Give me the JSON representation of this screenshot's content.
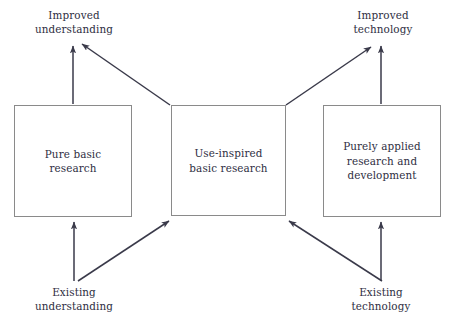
{
  "diagram": {
    "type": "flow-diagram",
    "colors": {
      "box_border": "#8a8a8a",
      "arrow": "#3a3a4a",
      "text": "#2e2e3f",
      "background": "#ffffff"
    },
    "nodes": [
      {
        "id": "pure-basic",
        "label": "Pure basic\nresearch",
        "shape": "rectangle",
        "x": 14,
        "y": 105,
        "width": 118,
        "height": 112
      },
      {
        "id": "use-inspired",
        "label": "Use-inspired\nbasic research",
        "shape": "rectangle",
        "x": 171,
        "y": 105,
        "width": 115,
        "height": 111
      },
      {
        "id": "purely-applied",
        "label": "Purely applied\nresearch and\ndevelopment",
        "shape": "rectangle",
        "x": 323,
        "y": 105,
        "width": 118,
        "height": 112
      }
    ],
    "labels": [
      {
        "id": "improved-understanding",
        "text": "Improved\nunderstanding",
        "position": "top-left"
      },
      {
        "id": "improved-technology",
        "text": "Improved\ntechnology",
        "position": "top-right"
      },
      {
        "id": "existing-understanding",
        "text": "Existing\nunderstanding",
        "position": "bottom-left"
      },
      {
        "id": "existing-technology",
        "text": "Existing\ntechnology",
        "position": "bottom-right"
      }
    ],
    "arrows": [
      {
        "id": "pure-basic-to-improved-understanding",
        "from": "pure-basic",
        "to": "improved-understanding",
        "style": "vertical"
      },
      {
        "id": "use-inspired-to-improved-understanding",
        "from": "use-inspired",
        "to": "improved-understanding",
        "style": "diagonal"
      },
      {
        "id": "use-inspired-to-improved-technology",
        "from": "use-inspired",
        "to": "improved-technology",
        "style": "diagonal"
      },
      {
        "id": "applied-to-improved-technology",
        "from": "purely-applied",
        "to": "improved-technology",
        "style": "vertical"
      },
      {
        "id": "existing-understanding-to-pure-basic",
        "from": "existing-understanding",
        "to": "pure-basic",
        "style": "vertical"
      },
      {
        "id": "existing-understanding-to-use-inspired",
        "from": "existing-understanding",
        "to": "use-inspired",
        "style": "diagonal"
      },
      {
        "id": "existing-technology-to-use-inspired",
        "from": "existing-technology",
        "to": "use-inspired",
        "style": "diagonal"
      },
      {
        "id": "existing-technology-to-applied",
        "from": "existing-technology",
        "to": "purely-applied",
        "style": "vertical"
      }
    ]
  }
}
